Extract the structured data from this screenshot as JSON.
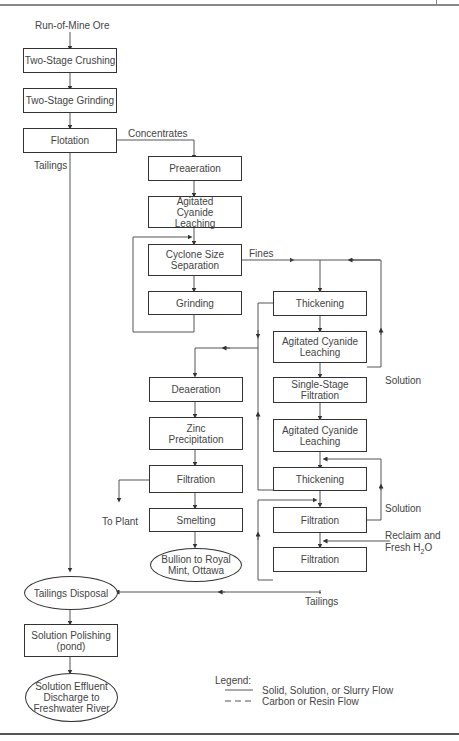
{
  "diagram": {
    "input_label": "Run-of-Mine Ore",
    "nodes": {
      "crushing": "Two-Stage Crushing",
      "grinding1": "Two-Stage Grinding",
      "flotation": "Flotation",
      "preaeration": "Preaeration",
      "leach1": "Agitated Cyanide Leaching",
      "cyclone": "Cyclone Size Separation",
      "grinding2": "Grinding",
      "thickening1": "Thickening",
      "leach2": "Agitated Cyanide Leaching",
      "single_filtration": "Single-Stage Filtration",
      "leach3": "Agitated Cyanide Leaching",
      "thickening2": "Thickening",
      "filtration_a": "Filtration",
      "filtration_b": "Filtration",
      "deaeration": "Deaeration",
      "zinc": "Zinc Precipitation",
      "filtration_c": "Filtration",
      "smelting": "Smelting",
      "bullion": "Bullion to Royal Mint, Ottawa",
      "tailings_disposal": "Tailings Disposal",
      "polishing": "Solution Polishing (pond)",
      "discharge": "Solution Effluent Discharge to Freshwater River"
    },
    "edge_labels": {
      "concentrates": "Concentrates",
      "tailings_flotation": "Tailings",
      "fines": "Fines",
      "solution1": "Solution",
      "solution2": "Solution",
      "reclaim_line1": "Reclaim and",
      "reclaim_line2_prefix": "Fresh H",
      "reclaim_line2_sub": "2",
      "reclaim_line2_suffix": "O",
      "to_plant": "To Plant",
      "tailings_final": "Tailings"
    },
    "legend": {
      "title": "Legend:",
      "solid": "Solid, Solution, or Slurry Flow",
      "dashed": "Carbon or Resin Flow"
    }
  }
}
